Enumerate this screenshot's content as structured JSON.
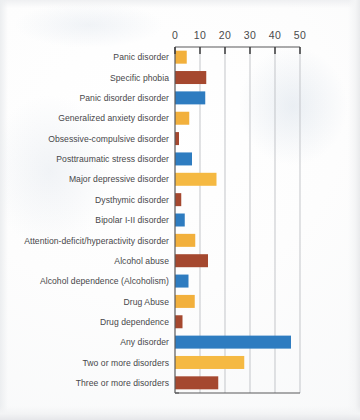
{
  "chart_data": {
    "type": "bar",
    "orientation": "horizontal",
    "title": "",
    "xlabel": "",
    "ylabel": "",
    "xlim": [
      0,
      50
    ],
    "xticks": [
      0,
      10,
      20,
      30,
      40,
      50
    ],
    "xtick_labels": [
      "0",
      "10",
      "20",
      "30",
      "40",
      "50"
    ],
    "grid": true,
    "legend": false,
    "categories": [
      "Panic disorder",
      "Specific phobia",
      "Panic disorder disorder",
      "Generalized anxiety disorder",
      "Obsessive-compulsive disorder",
      "Posttraumatic stress disorder",
      "Major depressive disorder",
      "Dysthymic disorder",
      "Bipolar I-II disorder",
      "Attention-deficit/hyperactivity disorder",
      "Alcohol abuse",
      "Alcohol dependence (Alcoholism)",
      "Drug Abuse",
      "Drug dependence",
      "Any disorder",
      "Two or more disorders",
      "Three or more disorders"
    ],
    "values": [
      4.7,
      12.5,
      12.1,
      5.7,
      1.6,
      6.8,
      16.6,
      2.5,
      3.9,
      8.1,
      13.2,
      5.4,
      7.9,
      3.0,
      46.4,
      27.7,
      17.3
    ],
    "bar_colors": [
      "#F2B03C",
      "#A5482F",
      "#2E7CC0",
      "#F2B03C",
      "#A5482F",
      "#2E7CC0",
      "#F5B942",
      "#A5482F",
      "#2E7CC0",
      "#F2B03C",
      "#A5482F",
      "#2E7CC0",
      "#F2B03C",
      "#A5482F",
      "#2E7CC0",
      "#F5B942",
      "#A5482F"
    ],
    "palette": {
      "orange": "#F2B03C",
      "blue": "#2E7CC0",
      "brown": "#A5482F"
    }
  },
  "colors": {
    "axis": "#59595B",
    "grid": "#B9BCC0",
    "text": "#47474A",
    "paper": "#FFFFFF"
  }
}
